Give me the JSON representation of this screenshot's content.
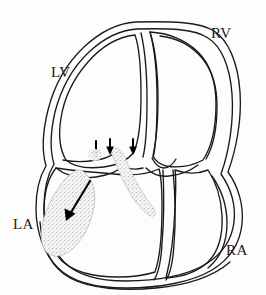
{
  "figure": {
    "background_color": "#fdfdfd",
    "outline_color": "#1a1a1a",
    "stipple_color": "#9a9a9a",
    "arrow_color": "#000000"
  },
  "labels": {
    "lv": "LV",
    "rv": "RV",
    "la": "LA",
    "ra": "RA"
  },
  "annotations": {
    "valve_arrows": [
      {
        "name": "valve-arrow-left",
        "x": 96,
        "y": 146
      },
      {
        "name": "valve-arrow-middle",
        "x": 110,
        "y": 143
      },
      {
        "name": "valve-arrow-right",
        "x": 133,
        "y": 143
      }
    ],
    "jet_arrow": {
      "name": "regurgitant-jet-arrow",
      "from_x": 88,
      "from_y": 183,
      "to_x": 66,
      "to_y": 219
    }
  },
  "regions": {
    "large_jet": "stippled regurgitant jet in left atrium",
    "narrow_jet": "stippled narrow jet below mitral valve"
  }
}
